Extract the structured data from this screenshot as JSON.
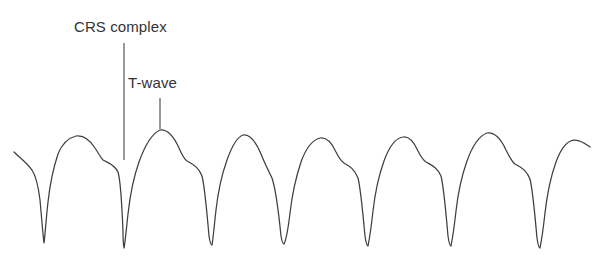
{
  "figure": {
    "background_color": "#ffffff",
    "trace_color": "#3f3f3f",
    "label_color": "#333333",
    "leader_color": "#55555a",
    "width": 603,
    "height": 265
  },
  "labels": {
    "qrs": {
      "text": "CRS complex",
      "x": 74,
      "y": 18
    },
    "twave": {
      "text": "T-wave",
      "x": 128,
      "y": 74
    }
  },
  "leaders": {
    "qrs_line": {
      "x": 124,
      "y_top": 43,
      "y_bottom": 160
    },
    "twave_line": {
      "x": 160,
      "y_top": 98,
      "y_bottom": 129
    }
  },
  "chart_data": {
    "type": "line",
    "title": "",
    "xlabel": "",
    "ylabel": "",
    "grid": false,
    "legend": "none",
    "annotations": [
      {
        "label": "CRS complex",
        "points_to": "QRS downward deflection at x=124"
      },
      {
        "label": "T-wave",
        "points_to": "T-wave peak at x=160"
      }
    ],
    "beat_count": 7,
    "beat_spacing_px": 84,
    "qrs_trough_x": [
      44,
      124,
      212,
      292,
      378,
      462,
      548
    ],
    "qrs_trough_y": [
      243,
      248,
      245,
      243,
      243,
      243,
      248
    ],
    "t_peak_x": [
      76,
      160,
      243,
      327,
      408,
      495,
      578
    ],
    "t_peak_y": [
      136,
      130,
      135,
      138,
      137,
      133,
      140
    ],
    "path": "M 14,152 C 20,158 26,162 32,170 C 36,176 38,184 40,200 C 42,222 43,236 44,243 C 45,236 46,220 48,202 C 50,184 54,166 58,154 C 62,144 68,138 76,136 C 84,135 90,140 95,148 C 99,154 101,158 103,160 C 108,163 114,164 118,172 C 121,182 122,206 123,232 C 123,242 124,248 124,248 C 125,244 126,232 128,214 C 130,196 134,176 139,162 C 144,148 151,134 160,130 C 168,129 174,137 179,148 C 182,155 184,159 187,161 C 192,164 198,166 202,176 C 205,188 207,214 209,236 C 210,243 211,245 212,245 C 213,240 214,228 216,210 C 218,192 222,174 227,160 C 232,146 237,137 243,135 C 250,134 256,142 261,154 C 265,164 268,170 272,178 C 276,190 279,216 281,236 C 282,242 283,244 284,244 C 286,240 288,230 290,213 C 292,196 296,177 301,162 C 306,148 312,140 320,138 C 327,137 332,143 336,152 C 339,158 341,161 344,163 C 349,166 354,168 358,178 C 361,190 363,216 365,236 C 366,243 367,246 368,246 C 369,241 371,229 373,211 C 375,193 379,175 384,161 C 389,147 396,138 403,137 C 409,136 414,142 418,151 C 421,157 423,160 426,162 C 431,165 437,167 441,176 C 444,188 446,214 448,236 C 449,243 450,246 451,246 C 452,241 454,229 456,211 C 458,193 462,175 467,161 C 472,147 479,136 487,133 C 495,132 501,139 506,150 C 510,158 512,162 515,164 C 520,167 526,169 530,179 C 533,191 535,217 537,238 C 538,245 539,248 540,248 C 541,243 543,231 545,213 C 547,195 551,176 556,162 C 561,148 568,140 575,140 C 581,140 586,144 590,147"
  }
}
